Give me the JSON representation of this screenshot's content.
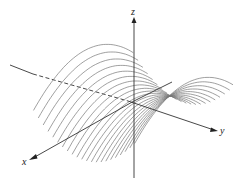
{
  "figure": {
    "type": "3d-surface-diagram",
    "surface": "z = y^2 - x^2",
    "curve_count": 22,
    "curve_color": "#777777",
    "axis_color": "#333333",
    "axes": {
      "x": {
        "label": "x"
      },
      "y": {
        "label": "y"
      },
      "z": {
        "label": "z"
      }
    }
  }
}
